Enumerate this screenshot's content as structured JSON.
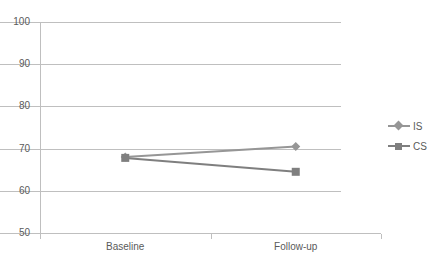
{
  "chart_data": {
    "type": "line",
    "title": "",
    "xlabel": "",
    "ylabel": "",
    "categories": [
      "Baseline",
      "Follow-up"
    ],
    "series": [
      {
        "name": "IS",
        "values": [
          68.0,
          70.5
        ],
        "color": "#969696",
        "marker": "diamond"
      },
      {
        "name": "CS",
        "values": [
          67.8,
          64.5
        ],
        "color": "#7f7f7f",
        "marker": "square"
      }
    ],
    "ylim": [
      50,
      100
    ],
    "yticks": [
      50,
      60,
      70,
      80,
      90,
      100
    ],
    "ytick_labels": [
      "50",
      "60",
      "70",
      "80",
      "90",
      "100"
    ],
    "grid": true,
    "legend_position": "right",
    "axis_color": "#bfbfbf",
    "text_color": "#5a5a5a",
    "background": "#ffffff"
  },
  "legend": {
    "entries": [
      {
        "label": "IS"
      },
      {
        "label": "CS"
      }
    ]
  },
  "axes": {
    "x_labels": [
      "Baseline",
      "Follow-up"
    ],
    "y_labels": [
      "100",
      "90",
      "80",
      "70",
      "60",
      "50"
    ]
  }
}
